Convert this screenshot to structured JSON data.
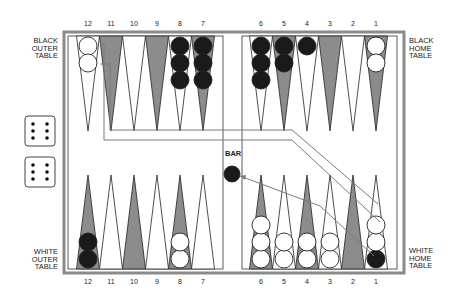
{
  "labels": {
    "black_outer": [
      "BLACK",
      "OUTER",
      "TABLE"
    ],
    "black_home": [
      "BLACK",
      "HOME",
      "TABLE"
    ],
    "white_outer": [
      "WHITE",
      "OUTER",
      "TABLE"
    ],
    "white_home": [
      "WHITE",
      "HOME",
      "TABLE"
    ],
    "bar": "BAR"
  },
  "top_numbers": [
    "12",
    "11",
    "10",
    "9",
    "8",
    "7",
    "6",
    "5",
    "4",
    "3",
    "2",
    "1"
  ],
  "bottom_numbers": [
    "12",
    "11",
    "10",
    "9",
    "8",
    "7",
    "6",
    "5",
    "4",
    "3",
    "2",
    "1"
  ],
  "dice": [
    6,
    6
  ],
  "colors": {
    "frame": "#8a8a8a",
    "shaded_point": "#8c8c8c",
    "black_checker": "#1a1a1a",
    "white_checker": "#ffffff",
    "arrow": "#7a7a7a"
  },
  "top_points": [
    {
      "n": 12,
      "shade": "white",
      "checkers": [
        {
          "c": "white",
          "n": 2
        }
      ]
    },
    {
      "n": 11,
      "shade": "gray",
      "checkers": []
    },
    {
      "n": 10,
      "shade": "white",
      "checkers": []
    },
    {
      "n": 9,
      "shade": "gray",
      "checkers": []
    },
    {
      "n": 8,
      "shade": "white",
      "checkers": [
        {
          "c": "black",
          "n": 3
        }
      ]
    },
    {
      "n": 7,
      "shade": "gray",
      "checkers": [
        {
          "c": "black",
          "n": 3
        }
      ]
    },
    {
      "n": 6,
      "shade": "white",
      "checkers": [
        {
          "c": "black",
          "n": 3
        }
      ]
    },
    {
      "n": 5,
      "shade": "gray",
      "checkers": [
        {
          "c": "black",
          "n": 2
        }
      ]
    },
    {
      "n": 4,
      "shade": "white",
      "checkers": [
        {
          "c": "black",
          "n": 1
        }
      ]
    },
    {
      "n": 3,
      "shade": "gray",
      "checkers": []
    },
    {
      "n": 2,
      "shade": "white",
      "checkers": []
    },
    {
      "n": 1,
      "shade": "gray",
      "checkers": [
        {
          "c": "white",
          "n": 2
        }
      ]
    }
  ],
  "bottom_points": [
    {
      "n": 12,
      "shade": "gray",
      "checkers": [
        {
          "c": "black",
          "n": 2
        }
      ]
    },
    {
      "n": 11,
      "shade": "white",
      "checkers": []
    },
    {
      "n": 10,
      "shade": "gray",
      "checkers": []
    },
    {
      "n": 9,
      "shade": "white",
      "checkers": []
    },
    {
      "n": 8,
      "shade": "gray",
      "checkers": [
        {
          "c": "white",
          "n": 2
        }
      ]
    },
    {
      "n": 7,
      "shade": "white",
      "checkers": []
    },
    {
      "n": 6,
      "shade": "gray",
      "checkers": [
        {
          "c": "white",
          "n": 3
        }
      ]
    },
    {
      "n": 5,
      "shade": "white",
      "checkers": [
        {
          "c": "white",
          "n": 2
        }
      ]
    },
    {
      "n": 4,
      "shade": "gray",
      "checkers": [
        {
          "c": "white",
          "n": 2
        }
      ]
    },
    {
      "n": 3,
      "shade": "white",
      "checkers": [
        {
          "c": "white",
          "n": 2
        }
      ]
    },
    {
      "n": 2,
      "shade": "gray",
      "checkers": []
    },
    {
      "n": 1,
      "shade": "white",
      "checkers": [
        {
          "c": "black",
          "n": 1
        },
        {
          "c": "white",
          "n": 2
        }
      ]
    }
  ],
  "bar_checkers": [
    {
      "c": "black",
      "n": 1
    }
  ]
}
